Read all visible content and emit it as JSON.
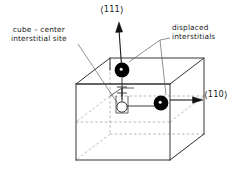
{
  "figure": {
    "background_color": "#ffffff",
    "line_color": "#2b2b2b",
    "dashed_line_color": "#8c8c8c",
    "sphere_color": "#000000",
    "open_site_fill": "#ffffff",
    "text_color": "#1a1a1a"
  },
  "labels": {
    "center_site_line1": "cube – center",
    "center_site_line2": "interstitial site",
    "displaced_line1": "displaced",
    "displaced_line2": "interstitials",
    "direction_111_open": "⟨",
    "direction_111_value": "111",
    "direction_111_close": "⟩",
    "direction_110_open": "⟨",
    "direction_110_value": "110",
    "direction_110_close": "⟩"
  },
  "annotations": {
    "sphere_top_name": "displaced interstitial along 111",
    "sphere_right_name": "displaced interstitial along 110",
    "open_circle_name": "cube-center interstitial site",
    "arrow_111_name": "crystallographic direction arrow 111",
    "arrow_110_name": "crystallographic direction arrow 110"
  }
}
